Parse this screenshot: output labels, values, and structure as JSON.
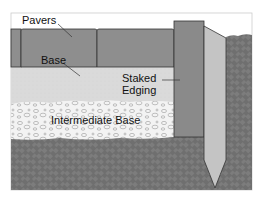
{
  "diagram": {
    "labels": {
      "pavers": "Pavers",
      "base": "Base",
      "staked_edging_line1": "Staked",
      "staked_edging_line2": "Edging",
      "intermediate_base": "Intermediate Base"
    },
    "layers": [
      {
        "name": "Pavers",
        "color": "#8c8c8c"
      },
      {
        "name": "Base",
        "color": "#d9d9d9"
      },
      {
        "name": "Intermediate Base",
        "color": "#f2f2f2"
      },
      {
        "name": "Soil",
        "color": "#6e6e6e"
      }
    ],
    "colors": {
      "pavers": "#8e8e8e",
      "base": "#dadada",
      "gravel": "#f3f3f3",
      "soil": "#6f6f6f",
      "edging": "#8a8a8a",
      "stake": "#c4c4c4",
      "outline": "#333333"
    }
  }
}
